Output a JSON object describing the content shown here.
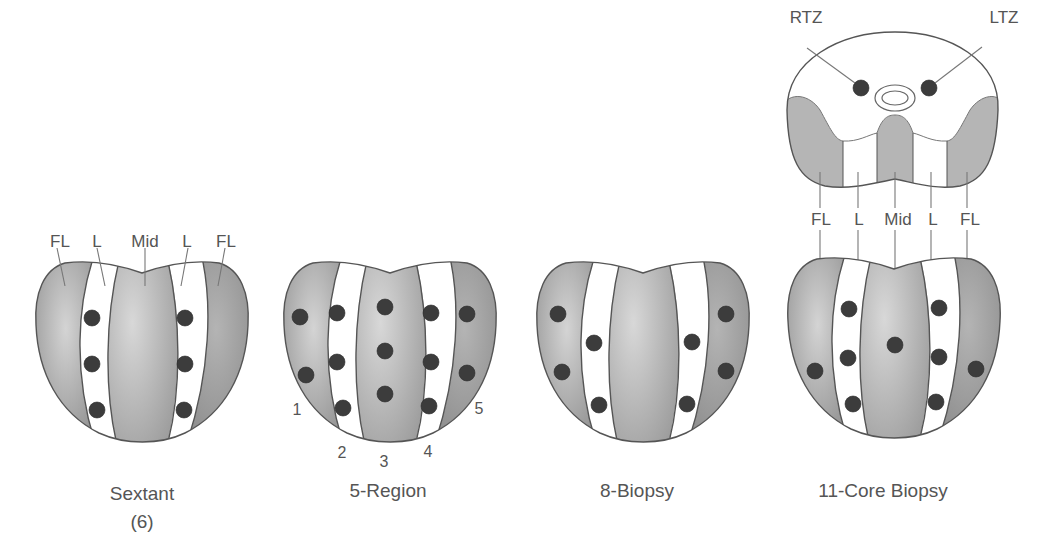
{
  "colors": {
    "zone_gray": "#a9a9a9",
    "zone_white": "#ffffff",
    "core_dot": "#3c3c3c",
    "text": "#555555",
    "outline": "#555555"
  },
  "diagrams": [
    {
      "id": "sextant",
      "caption_line1": "Sextant",
      "caption_line2": "(6)",
      "zone_labels": [
        "FL",
        "L",
        "Mid",
        "L",
        "FL"
      ],
      "core_count": 6
    },
    {
      "id": "five-region",
      "caption_line1": "5-Region",
      "region_numbers": [
        "1",
        "2",
        "3",
        "4",
        "5"
      ],
      "core_count": 13
    },
    {
      "id": "eight-biopsy",
      "caption_line1": "8-Biopsy",
      "core_count": 8
    },
    {
      "id": "eleven-core",
      "caption_line1": "11-Core Biopsy",
      "zone_labels": [
        "FL",
        "L",
        "Mid",
        "L",
        "FL"
      ],
      "transition_zone_labels": [
        "RTZ",
        "LTZ"
      ],
      "core_count": 11
    }
  ]
}
